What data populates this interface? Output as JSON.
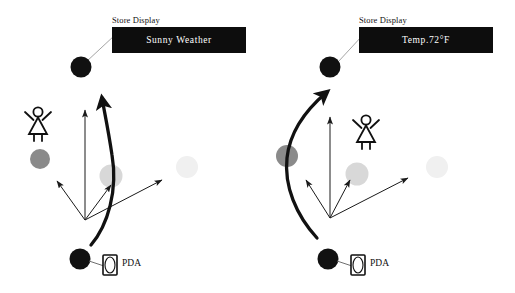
{
  "figure": {
    "background_color": "#ffffff",
    "panels": [
      {
        "id": "left",
        "display": {
          "caption": "Store Display",
          "text": "Sunny Weather",
          "box_color": "#0d0d0d",
          "text_color": "#ffffff"
        },
        "pda": {
          "label": "PDA"
        },
        "nodes": [
          {
            "name": "store-display-node",
            "shade": "black",
            "color": "#111111"
          },
          {
            "name": "user-device-node",
            "shade": "black",
            "color": "#111111"
          },
          {
            "name": "context-node-near",
            "shade": "medium-gray",
            "color": "#8a8a8a"
          },
          {
            "name": "context-node-mid",
            "shade": "light-gray",
            "color": "#d8d8d8"
          },
          {
            "name": "context-node-far",
            "shade": "faint-gray",
            "color": "#f0f0f0"
          }
        ],
        "person_icon": "person-figure-icon",
        "arrow_count": 4,
        "trajectory": "curved-path-arrow"
      },
      {
        "id": "right",
        "display": {
          "caption": "Store Display",
          "text": "Temp.72°F",
          "box_color": "#0d0d0d",
          "text_color": "#ffffff"
        },
        "pda": {
          "label": "PDA"
        },
        "nodes": [
          {
            "name": "store-display-node",
            "shade": "black",
            "color": "#111111"
          },
          {
            "name": "user-device-node",
            "shade": "black",
            "color": "#111111"
          },
          {
            "name": "context-node-near",
            "shade": "medium-gray",
            "color": "#8a8a8a"
          },
          {
            "name": "context-node-mid",
            "shade": "light-gray",
            "color": "#d8d8d8"
          },
          {
            "name": "context-node-far",
            "shade": "faint-gray",
            "color": "#f0f0f0"
          }
        ],
        "person_icon": "person-figure-icon",
        "arrow_count": 4,
        "trajectory": "curved-path-arrow"
      }
    ]
  }
}
